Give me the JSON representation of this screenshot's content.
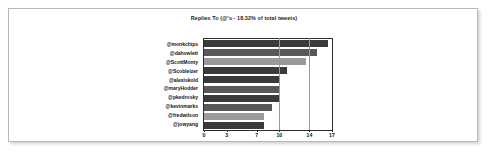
{
  "chart_data": {
    "type": "bar",
    "orientation": "horizontal",
    "title": "Replies To (@'s - 18.32% of total tweets)",
    "xlabel": "",
    "ylabel": "",
    "categories": [
      "@monkchips",
      "@dahowlett",
      "@ScottMonty",
      "@Scobleizer",
      "@alexiskold",
      "@maryHodder",
      "@pkedrosky",
      "@kevinmarks",
      "@fredwilson",
      "@jowyang"
    ],
    "values": [
      16.5,
      15,
      13.5,
      11,
      10,
      10,
      10,
      9,
      8,
      8
    ],
    "xlim": [
      0,
      17
    ],
    "xticks": [
      0,
      3,
      7,
      10,
      14,
      17
    ],
    "gridlines": [
      10,
      14
    ],
    "grid": true,
    "legend": false,
    "bar_colors": [
      "#3a3a3a",
      "#585858",
      "#9a9a9a",
      "#3a3a3a",
      "#3a3a3a",
      "#585858",
      "#3a3a3a",
      "#585858",
      "#9a9a9a",
      "#3a3a3a"
    ]
  },
  "colors": {
    "page_border": "#b8b8b8",
    "plot_border": "#2b2b2b",
    "gridline": "#9a9a9a",
    "background": "#ffffff",
    "text": "#111111"
  }
}
